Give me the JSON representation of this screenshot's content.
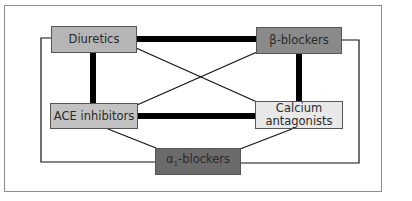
{
  "diagram": {
    "type": "network",
    "nodes": [
      {
        "id": "diuretics",
        "label": "Diuretics",
        "fill": "#b5b5b5"
      },
      {
        "id": "beta",
        "label": "β-blockers",
        "fill": "#8a8a8a"
      },
      {
        "id": "ace",
        "label": "ACE inhibitors",
        "fill": "#c2c2c2"
      },
      {
        "id": "calcium",
        "label_line1": "Calcium",
        "label_line2": "antagonists",
        "fill": "#e8e8e8"
      },
      {
        "id": "alpha",
        "label_prefix": "α",
        "label_sub": "1",
        "label_suffix": "-blockers",
        "fill": "#6b6b6b"
      }
    ],
    "edges": [
      {
        "from": "diuretics",
        "to": "beta",
        "weight": "thick"
      },
      {
        "from": "diuretics",
        "to": "ace",
        "weight": "thick"
      },
      {
        "from": "beta",
        "to": "calcium",
        "weight": "thick"
      },
      {
        "from": "ace",
        "to": "calcium",
        "weight": "thick"
      },
      {
        "from": "diuretics",
        "to": "calcium",
        "weight": "thin"
      },
      {
        "from": "beta",
        "to": "ace",
        "weight": "thin"
      },
      {
        "from": "ace",
        "to": "alpha",
        "weight": "thin"
      },
      {
        "from": "calcium",
        "to": "alpha",
        "weight": "thin"
      },
      {
        "from": "diuretics",
        "to": "alpha",
        "weight": "thin",
        "routing": "outer-left"
      },
      {
        "from": "beta",
        "to": "alpha",
        "weight": "thin",
        "routing": "outer-right"
      }
    ]
  }
}
